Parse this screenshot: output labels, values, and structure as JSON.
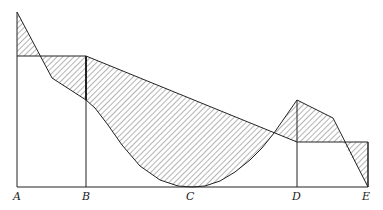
{
  "figure": {
    "width": 383,
    "height": 210,
    "colors": {
      "line": "#222222",
      "hatch": "#444444",
      "background": "#ffffff"
    },
    "baseline_y": 187,
    "points": [
      {
        "label": "A",
        "x": 17,
        "top": 12,
        "level": 56
      },
      {
        "label": "B",
        "x": 86,
        "level": 56,
        "lower": 100
      },
      {
        "label": "C",
        "x": 192
      },
      {
        "label": "D",
        "x": 297,
        "peak": 100,
        "level": 142
      },
      {
        "label": "E",
        "x": 368,
        "level": 142
      }
    ],
    "labels": [
      "A",
      "B",
      "C",
      "D",
      "E"
    ]
  }
}
